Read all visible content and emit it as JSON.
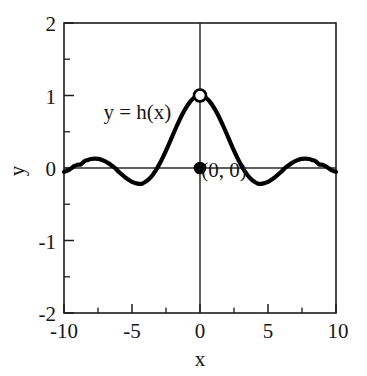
{
  "chart_data": {
    "type": "line",
    "title": "",
    "subtitle": "",
    "xlabel": "x",
    "ylabel": "y",
    "xlim": [
      -10,
      2
    ],
    "ylim": [
      -2,
      2
    ],
    "xlim_max": 10,
    "grid": false,
    "legend": null,
    "function_expression": "h(x) = sin(x)/x",
    "x_ticks": [
      -10,
      -5,
      0,
      5,
      10
    ],
    "x_tick_labels": [
      "-10",
      "-5",
      "0",
      "5",
      "10"
    ],
    "x_minor_ticks": [
      -7.5,
      -2.5,
      2.5,
      7.5
    ],
    "y_ticks": [
      2,
      1,
      0,
      -1,
      -2
    ],
    "y_tick_labels": [
      "2",
      "1",
      "0",
      "-1",
      "-2"
    ],
    "y_minor_ticks": [
      1.5,
      0.5,
      -0.5,
      -1.5
    ],
    "series": [
      {
        "name": "y = h(x)",
        "x": [
          -10.0,
          -9.75,
          -9.5,
          -9.25,
          -9.0,
          -8.75,
          -8.5,
          -8.25,
          -8.0,
          -7.75,
          -7.5,
          -7.25,
          -7.0,
          -6.75,
          -6.5,
          -6.25,
          -6.0,
          -5.75,
          -5.5,
          -5.25,
          -5.0,
          -4.75,
          -4.5,
          -4.25,
          -4.0,
          -3.75,
          -3.5,
          -3.25,
          -3.0,
          -2.75,
          -2.5,
          -2.25,
          -2.0,
          -1.75,
          -1.5,
          -1.25,
          -1.0,
          -0.75,
          -0.5,
          -0.25,
          0.0,
          0.25,
          0.5,
          0.75,
          1.0,
          1.25,
          1.5,
          1.75,
          2.0,
          2.25,
          2.5,
          2.75,
          3.0,
          3.25,
          3.5,
          3.75,
          4.0,
          4.25,
          4.5,
          4.75,
          5.0,
          5.25,
          5.5,
          5.75,
          6.0,
          6.25,
          6.5,
          6.75,
          7.0,
          7.25,
          7.5,
          7.75,
          8.0,
          8.25,
          8.5,
          8.75,
          9.0,
          9.25,
          9.5,
          9.75,
          10.0
        ],
        "y": [
          -0.054,
          -0.037,
          -0.008,
          0.025,
          0.046,
          0.051,
          0.094,
          0.111,
          0.124,
          0.128,
          0.125,
          0.114,
          0.094,
          0.067,
          0.035,
          0.0,
          -0.047,
          -0.089,
          -0.129,
          -0.162,
          -0.192,
          -0.208,
          -0.218,
          -0.216,
          -0.189,
          -0.152,
          -0.1,
          -0.034,
          0.047,
          0.14,
          0.239,
          0.345,
          0.455,
          0.562,
          0.665,
          0.759,
          0.841,
          0.909,
          0.959,
          0.99,
          1.0,
          0.99,
          0.959,
          0.909,
          0.841,
          0.759,
          0.665,
          0.562,
          0.455,
          0.345,
          0.239,
          0.14,
          0.047,
          -0.034,
          -0.1,
          -0.152,
          -0.189,
          -0.216,
          -0.218,
          -0.208,
          -0.192,
          -0.162,
          -0.129,
          -0.089,
          -0.047,
          0.0,
          0.035,
          0.067,
          0.094,
          0.114,
          0.125,
          0.128,
          0.124,
          0.111,
          0.094,
          0.051,
          0.046,
          0.025,
          -0.008,
          -0.037,
          -0.054
        ]
      }
    ],
    "annotations": [
      {
        "name": "function-label",
        "text": "y = h(x)",
        "x": -7.1,
        "y": 0.68
      },
      {
        "name": "origin-point-label",
        "text": "(0, 0)",
        "x": 0.1,
        "y": -0.12
      }
    ],
    "markers": [
      {
        "name": "open-circle-limit",
        "style": "open",
        "x": 0,
        "y": 1,
        "meaning": "limit value, not attained"
      },
      {
        "name": "filled-circle-value",
        "style": "filled",
        "x": 0,
        "y": 0,
        "meaning": "defined function value h(0) = 0"
      }
    ],
    "vertical_reference_line": {
      "x": 0,
      "y_from": 2,
      "y_to": -2
    },
    "horizontal_reference_line": {
      "y": 0,
      "x_from": -10,
      "x_to": 10
    },
    "colors": {
      "curve": "#000000",
      "frame": "#1d1d1d",
      "text": "#161616",
      "background": "#ffffff",
      "marker_open_fill": "#ffffff"
    }
  }
}
